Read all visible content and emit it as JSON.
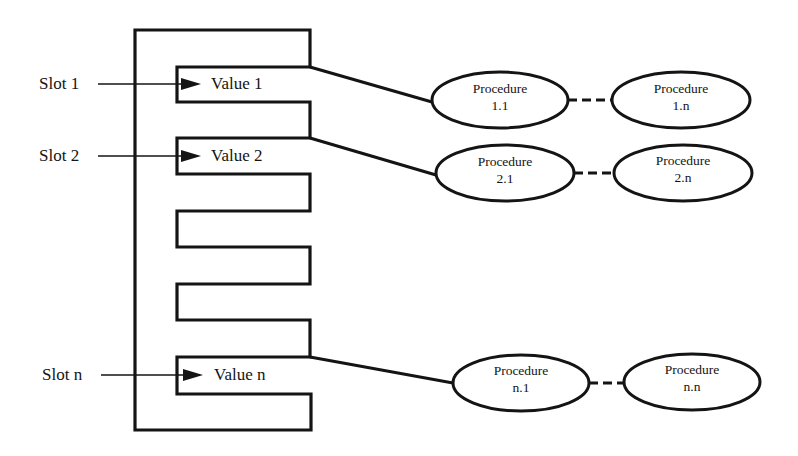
{
  "diagram": {
    "type": "frame-slot-procedure",
    "slots": [
      {
        "label": "Slot 1",
        "value": "Value 1",
        "procedures": [
          "Procedure",
          "1.1",
          "Procedure",
          "1.n"
        ]
      },
      {
        "label": "Slot 2",
        "value": "Value 2",
        "procedures": [
          "Procedure",
          "2.1",
          "Procedure",
          "2.n"
        ]
      },
      {
        "label": "Slot n",
        "value": "Value n",
        "procedures": [
          "Procedure",
          "n.1",
          "Procedure",
          "n.n"
        ]
      }
    ],
    "procedures": {
      "p11": {
        "title": "Procedure",
        "id": "1.1"
      },
      "p1n": {
        "title": "Procedure",
        "id": "1.n"
      },
      "p21": {
        "title": "Procedure",
        "id": "2.1"
      },
      "p2n": {
        "title": "Procedure",
        "id": "2.n"
      },
      "pn1": {
        "title": "Procedure",
        "id": "n.1"
      },
      "pnn": {
        "title": "Procedure",
        "id": "n.n"
      }
    },
    "stroke_color": "#141414",
    "background": "#ffffff"
  }
}
